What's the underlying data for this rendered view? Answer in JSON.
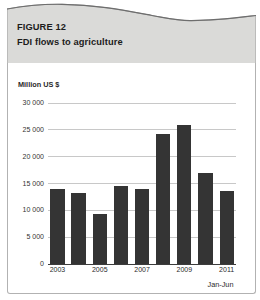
{
  "header": {
    "figure_label": "FIGURE 12",
    "title": "FDI flows to agriculture"
  },
  "chart_data": {
    "type": "bar",
    "title": "FDI flows to agriculture",
    "unit_label": "Million US $",
    "footnote": "Jan-Jun",
    "categories": [
      "2003",
      "2004",
      "2005",
      "2006",
      "2007",
      "2008",
      "2009",
      "2010",
      "2011"
    ],
    "values": [
      13900,
      13100,
      9300,
      14500,
      13800,
      24200,
      25800,
      16900,
      13600
    ],
    "x_tick_labels": [
      "2003",
      "2005",
      "2007",
      "2009",
      "2011"
    ],
    "x_tick_every": 2,
    "ylim": [
      0,
      30000
    ],
    "y_ticks": [
      30000,
      25000,
      20000,
      15000,
      10000,
      5000,
      0
    ],
    "y_tick_labels": [
      "30 000",
      "25 000",
      "20 000",
      "15 000",
      "10 000",
      "5 000",
      "0"
    ],
    "grid": true,
    "legend": "none",
    "bar_color": "#343434"
  },
  "colors": {
    "header_background": "#dadad8",
    "divider_bar": "#1b1b1b",
    "gridline": "#c8c8c8",
    "axis": "#3c3c3c",
    "bar": "#343434",
    "text": "#1c1c1c"
  }
}
